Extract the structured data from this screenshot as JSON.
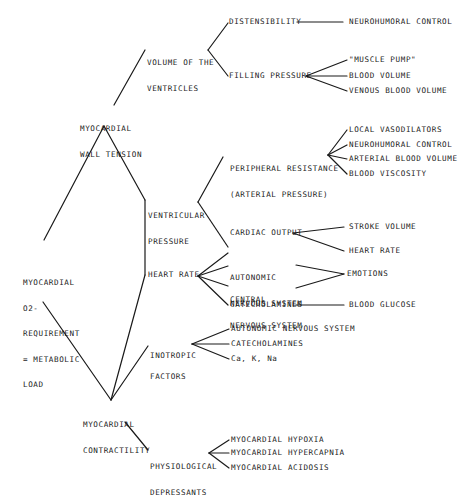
{
  "diagram": {
    "type": "tree",
    "root": "MYOCARDIAL O2-REQUIREMENT = METABOLIC LOAD",
    "nodes": {
      "root": {
        "lines": [
          "MYOCARDIAL",
          "O2-",
          "REQUIREMENT",
          "= METABOLIC",
          "LOAD"
        ]
      },
      "wall_tension": {
        "lines": [
          "MYOCARDIAL",
          "WALL TENSION"
        ]
      },
      "volume_ventricles": {
        "lines": [
          "VOLUME OF THE",
          "VENTRICLES"
        ]
      },
      "distensibility": {
        "label": "DISTENSIBILITY"
      },
      "neurohumoral_1": {
        "label": "NEUROHUMORAL CONTROL"
      },
      "filling_pressure": {
        "label": "FILLING PRESSURE"
      },
      "muscle_pump": {
        "label": "\"MUSCLE PUMP\""
      },
      "blood_volume": {
        "label": "BLOOD VOLUME"
      },
      "venous_blood_volume": {
        "label": "VENOUS BLOOD VOLUME"
      },
      "ventricular_pressure": {
        "lines": [
          "VENTRICULAR",
          "PRESSURE"
        ]
      },
      "peripheral_resistance": {
        "lines": [
          "PERIPHERAL RESISTANCE",
          "(ARTERIAL PRESSURE)"
        ]
      },
      "local_vasodilators": {
        "label": "LOCAL VASODILATORS"
      },
      "neurohumoral_2": {
        "label": "NEUROHUMORAL CONTROL"
      },
      "arterial_blood_volume": {
        "label": "ARTERIAL BLOOD VOLUME"
      },
      "blood_viscosity": {
        "label": "BLOOD VISCOSITY"
      },
      "cardiac_output": {
        "label": "CARDIAC OUTPUT"
      },
      "stroke_volume": {
        "label": "STROKE VOLUME"
      },
      "heart_rate_leaf": {
        "label": "HEART RATE"
      },
      "heart_rate": {
        "label": "HEART RATE"
      },
      "autonomic_ns": {
        "lines": [
          "AUTONOMIC",
          "NERVOUS SYSTEM"
        ]
      },
      "central_ns": {
        "lines": [
          "CENTRAL",
          "NERVOUS SYSTEM"
        ]
      },
      "emotions": {
        "label": "EMOTIONS"
      },
      "catecholamines_1": {
        "label": "CATECHOLAMINES"
      },
      "blood_glucose": {
        "label": "BLOOD GLUCOSE"
      },
      "inotropic_factors": {
        "lines": [
          "INOTROPIC",
          "FACTORS"
        ]
      },
      "autonomic_ns_full": {
        "label": "AUTONOMIC NERVOUS SYSTEM"
      },
      "catecholamines_2": {
        "label": "CATECHOLAMINES"
      },
      "ions": {
        "label": "Ca, K, Na"
      },
      "contractility": {
        "lines": [
          "MYOCARDIAL",
          "CONTRACTILITY"
        ]
      },
      "physiological_depressants": {
        "lines": [
          "PHYSIOLOGICAL",
          "DEPRESSANTS"
        ]
      },
      "hypoxia": {
        "label": "MYOCARDIAL HYPOXIA"
      },
      "hypercapnia": {
        "label": "MYOCARDIAL HYPERCAPNIA"
      },
      "acidosis": {
        "label": "MYOCARDIAL ACIDOSIS"
      }
    },
    "edges": [
      [
        "root",
        "wall_tension"
      ],
      [
        "root",
        "contractility"
      ],
      [
        "wall_tension",
        "volume_ventricles"
      ],
      [
        "wall_tension",
        "ventricular_pressure"
      ],
      [
        "volume_ventricles",
        "distensibility"
      ],
      [
        "volume_ventricles",
        "filling_pressure"
      ],
      [
        "distensibility",
        "neurohumoral_1"
      ],
      [
        "filling_pressure",
        "muscle_pump"
      ],
      [
        "filling_pressure",
        "blood_volume"
      ],
      [
        "filling_pressure",
        "venous_blood_volume"
      ],
      [
        "ventricular_pressure",
        "peripheral_resistance"
      ],
      [
        "ventricular_pressure",
        "cardiac_output"
      ],
      [
        "peripheral_resistance",
        "local_vasodilators"
      ],
      [
        "peripheral_resistance",
        "neurohumoral_2"
      ],
      [
        "peripheral_resistance",
        "arterial_blood_volume"
      ],
      [
        "peripheral_resistance",
        "blood_viscosity"
      ],
      [
        "cardiac_output",
        "stroke_volume"
      ],
      [
        "cardiac_output",
        "heart_rate_leaf"
      ],
      [
        "ventricular_pressure",
        "heart_rate"
      ],
      [
        "heart_rate",
        "contractility"
      ],
      [
        "heart_rate",
        "cardiac_output"
      ],
      [
        "heart_rate",
        "autonomic_ns"
      ],
      [
        "heart_rate",
        "central_ns"
      ],
      [
        "heart_rate",
        "catecholamines_1"
      ],
      [
        "autonomic_ns",
        "emotions"
      ],
      [
        "central_ns",
        "emotions"
      ],
      [
        "catecholamines_1",
        "blood_glucose"
      ],
      [
        "contractility",
        "inotropic_factors"
      ],
      [
        "inotropic_factors",
        "autonomic_ns_full"
      ],
      [
        "inotropic_factors",
        "catecholamines_2"
      ],
      [
        "inotropic_factors",
        "ions"
      ],
      [
        "contractility",
        "physiological_depressants"
      ],
      [
        "physiological_depressants",
        "hypoxia"
      ],
      [
        "physiological_depressants",
        "hypercapnia"
      ],
      [
        "physiological_depressants",
        "acidosis"
      ]
    ],
    "line_color": "#1a1a1a",
    "text_color": "#1a1a1a",
    "background": "#ffffff"
  }
}
